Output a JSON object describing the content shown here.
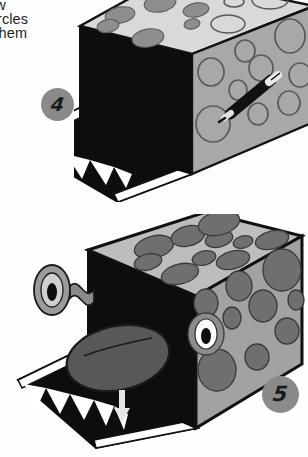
{
  "page": {
    "background_color": "#ffffff",
    "ink_color": "#231f20"
  },
  "instruction_text": {
    "lines": [
      "draw",
      "e circles",
      "nd them"
    ],
    "note": "body copy cropped at the left page margin"
  },
  "steps": [
    {
      "number": "4",
      "badge_color": "#8a8a8a",
      "badge_text_color": "#1a1a1a",
      "caption": "draw circles on the box with a marker",
      "illustration": {
        "name": "monster-box-step-4",
        "box_top_color": "#d9d9d9",
        "box_front_color": "#a8a8a8",
        "box_mouth_color": "#0d0d0d",
        "spot_filled_color": "#8e8e8e",
        "spot_outline_color": "#5a5a5a",
        "teeth_color": "#ffffff",
        "marker_body_color": "#111111",
        "marker_tip_color": "#e8e8e8",
        "filled_spots_top": 6,
        "outline_spots_top": 4,
        "filled_spots_front": 0,
        "outline_spots_front": 9
      }
    },
    {
      "number": "5",
      "badge_color": "#8a8a8a",
      "badge_text_color": "#1a1a1a",
      "caption": "add the eye and the tongue to finish the monster",
      "illustration": {
        "name": "monster-box-step-5",
        "box_top_color": "#bdbdbd",
        "box_front_color": "#a2a2a2",
        "box_mouth_color": "#0d0d0d",
        "spot_color": "#6f6f6f",
        "teeth_color": "#ffffff",
        "tongue_color": "#585858",
        "eye_white_color": "#ffffff",
        "eye_pupil_color": "#0d0d0d",
        "loose_eye_color": "#9b9b9b",
        "tab_color": "#8a8a8a",
        "arrow_color": "#e6e6e6",
        "filled_spots_top": 9,
        "filled_spots_front": 10
      }
    }
  ]
}
